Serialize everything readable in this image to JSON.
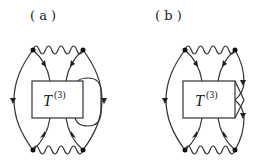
{
  "diagrams": [
    {
      "id": "a",
      "label": "( a )",
      "operator": "T",
      "operator_superscript": "(3)",
      "description": "Feynman-like diagram with two wavy interaction lines, four vertices, and a closed loop on the right side of the T(3) box"
    },
    {
      "id": "b",
      "label": "( b )",
      "operator": "T",
      "operator_superscript": "(3)",
      "description": "Feynman-like diagram with two wavy interaction lines, four vertices, and crossing lines at the right edge of the T(3) box"
    }
  ],
  "colors": {
    "line": "#333333",
    "background": "#ffffff"
  }
}
